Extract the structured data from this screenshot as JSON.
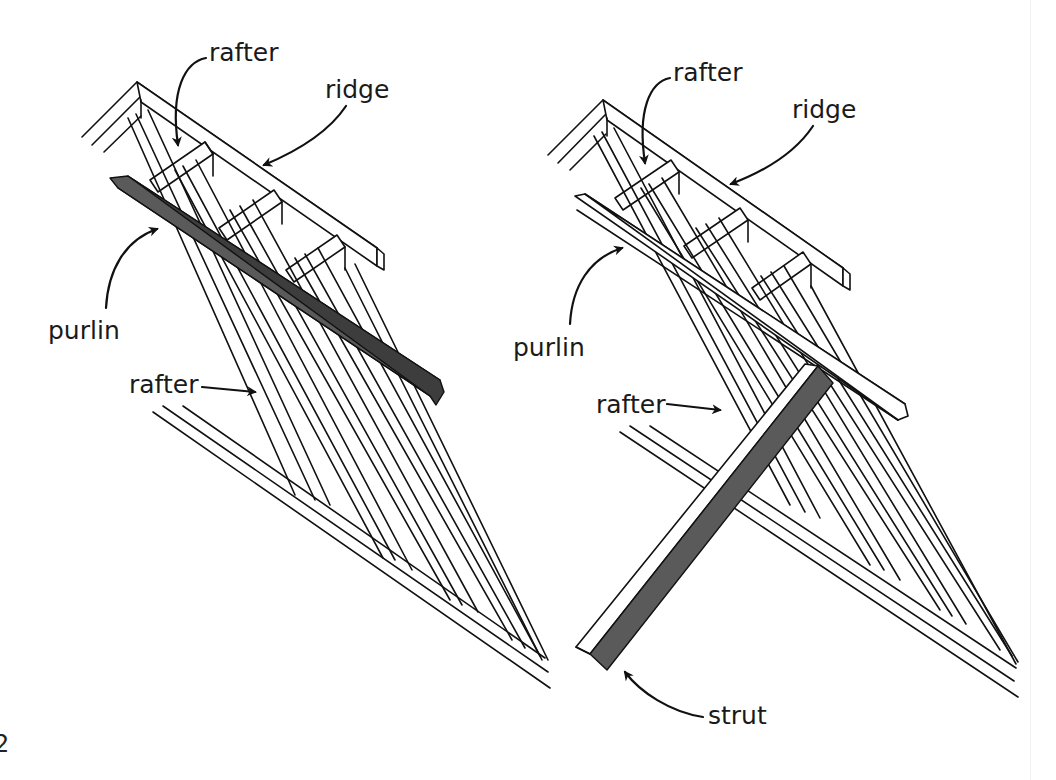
{
  "figure": {
    "margin_mark": "2",
    "colors": {
      "line": "#111111",
      "highlight_member": "#5a5a5a",
      "background": "#ffffff"
    }
  },
  "left_diagram": {
    "labels": {
      "rafter_top": "rafter",
      "ridge": "ridge",
      "purlin": "purlin",
      "rafter_side": "rafter"
    },
    "highlighted_member": "purlin"
  },
  "right_diagram": {
    "labels": {
      "rafter_top": "rafter",
      "ridge": "ridge",
      "purlin": "purlin",
      "rafter_side": "rafter",
      "strut": "strut"
    },
    "highlighted_member": "strut"
  }
}
